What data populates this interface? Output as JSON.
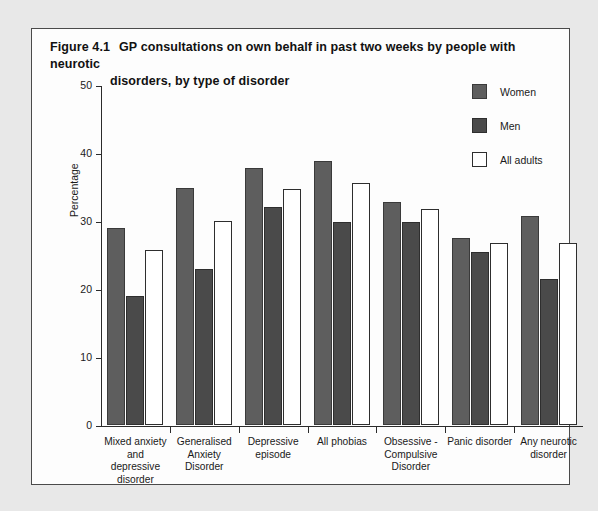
{
  "figure": {
    "number": "Figure 4.1",
    "title_line1": "GP consultations on own behalf in past two weeks by people with neurotic",
    "title_line2": "disorders, by type of disorder"
  },
  "legend": {
    "items": [
      {
        "label": "Women",
        "swatch": "women",
        "color": "#5e5e5e"
      },
      {
        "label": "Men",
        "swatch": "men",
        "color": "#4a4a4a"
      },
      {
        "label": "All adults",
        "swatch": "all",
        "color": "#ffffff"
      }
    ]
  },
  "chart_data": {
    "type": "bar",
    "xlabel": "",
    "ylabel": "Percentage",
    "ylim": [
      0,
      50
    ],
    "yticks": [
      0,
      10,
      20,
      30,
      40,
      50
    ],
    "ytick_labels": [
      "0",
      "10",
      "20",
      "30",
      "40",
      "50"
    ],
    "grid": false,
    "legend_position": "top-right",
    "categories": [
      "Mixed anxiety and depressive disorder",
      "Generalised Anxiety Disorder",
      "Depressive episode",
      "All phobias",
      "Obsessive - Compulsive Disorder",
      "Panic disorder",
      "Any neurotic disorder"
    ],
    "category_lines": [
      [
        "Mixed anxiety",
        "and",
        "depressive",
        "disorder"
      ],
      [
        "Generalised",
        "Anxiety",
        "Disorder"
      ],
      [
        "Depressive",
        "episode"
      ],
      [
        "All phobias"
      ],
      [
        "Obsessive -",
        "Compulsive",
        "Disorder"
      ],
      [
        "Panic disorder"
      ],
      [
        "Any neurotic",
        "disorder"
      ]
    ],
    "series": [
      {
        "name": "Women",
        "values": [
          29.0,
          34.9,
          37.8,
          38.8,
          32.8,
          27.5,
          30.8
        ]
      },
      {
        "name": "Men",
        "values": [
          19.0,
          22.9,
          32.0,
          29.9,
          29.9,
          25.5,
          21.4
        ]
      },
      {
        "name": "All adults",
        "values": [
          25.8,
          30.0,
          34.7,
          35.6,
          31.8,
          26.8,
          26.8
        ]
      }
    ]
  }
}
